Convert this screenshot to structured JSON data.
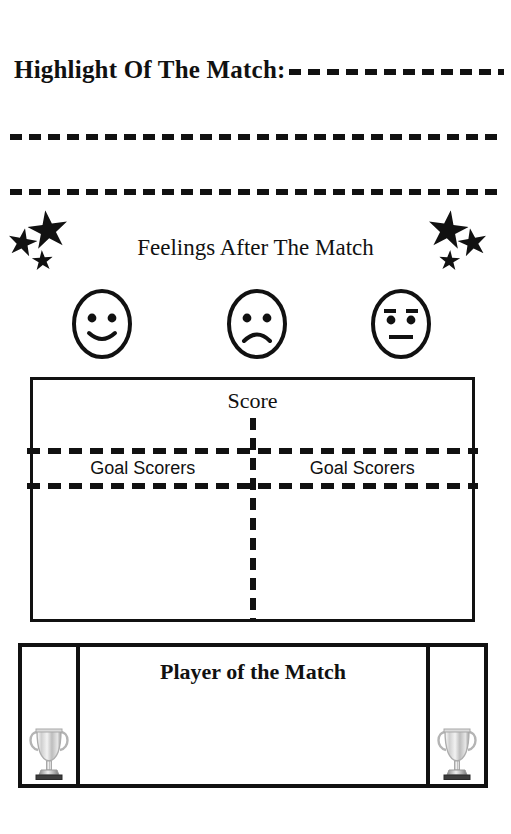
{
  "document": {
    "type": "match-report-worksheet",
    "background_color": "#ffffff",
    "ink_color": "#111111"
  },
  "highlight": {
    "label": "Highlight Of The Match:",
    "writing_lines": 3
  },
  "feelings": {
    "title": "Feelings After The Match",
    "faces": [
      {
        "name": "happy-face",
        "expression": "happy"
      },
      {
        "name": "sad-face",
        "expression": "sad"
      },
      {
        "name": "neutral-face",
        "expression": "neutral"
      }
    ],
    "star_clusters": [
      {
        "side": "left",
        "count": 3
      },
      {
        "side": "right",
        "count": 3
      }
    ]
  },
  "score": {
    "title": "Score",
    "columns": [
      {
        "header": "Goal Scorers",
        "side": "home"
      },
      {
        "header": "Goal Scorers",
        "side": "away"
      }
    ]
  },
  "player_of_the_match": {
    "title": "Player of the Match",
    "trophy_icon_left": "trophy-icon",
    "trophy_icon_right": "trophy-icon"
  }
}
